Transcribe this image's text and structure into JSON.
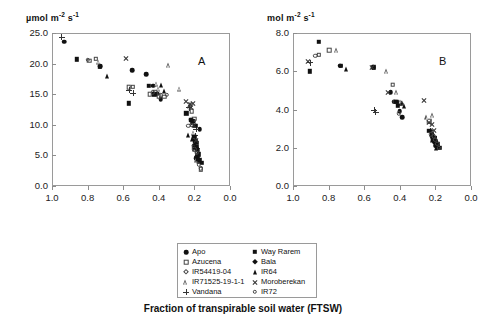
{
  "figure": {
    "xaxis_title": "Fraction of transpirable soil water (FTSW)"
  },
  "legend": {
    "left": [
      {
        "label": "Apo",
        "marker": "filled-circle"
      },
      {
        "label": "Azucena",
        "marker": "open-square"
      },
      {
        "label": "IR54419-04",
        "marker": "open-diamond"
      },
      {
        "label": "IR71525-19-1-1",
        "marker": "open-triangle"
      },
      {
        "label": "Vandana",
        "marker": "plus"
      }
    ],
    "right": [
      {
        "label": "Way Rarem",
        "marker": "filled-square"
      },
      {
        "label": "Bala",
        "marker": "filled-diamond"
      },
      {
        "label": "IR64",
        "marker": "filled-triangle"
      },
      {
        "label": "Moroberekan",
        "marker": "cross"
      },
      {
        "label": "IR72",
        "marker": "open-circle"
      }
    ]
  },
  "chart_data": [
    {
      "type": "scatter",
      "panel": "A",
      "title": "A",
      "unit_label": "µmol m⁻² s⁻¹",
      "ylabel": "µmol m⁻² s⁻¹",
      "xlabel": "Fraction of transpirable soil water (FTSW)",
      "xlim": [
        1.0,
        0.0
      ],
      "ylim": [
        0.0,
        25.0
      ],
      "xticks": [
        "1.0",
        "0.8",
        "0.6",
        "0.4",
        "0.2",
        "0.0"
      ],
      "yticks": [
        "0.0",
        "5.0",
        "10.0",
        "15.0",
        "20.0",
        "25.0"
      ],
      "x_reversed": true,
      "grid": false,
      "legend_position": "below-center",
      "series": [
        {
          "name": "Apo",
          "marker": "filled-circle",
          "points": [
            [
              0.93,
              23.6
            ],
            [
              0.73,
              19.6
            ],
            [
              0.55,
              18.9
            ],
            [
              0.47,
              18.3
            ],
            [
              0.43,
              16.4
            ],
            [
              0.41,
              15.1
            ],
            [
              0.39,
              14.2
            ],
            [
              0.22,
              10.8
            ],
            [
              0.205,
              10.6
            ],
            [
              0.17,
              9.3
            ],
            [
              0.2,
              6.6
            ],
            [
              0.185,
              5.9
            ],
            [
              0.19,
              4.5
            ]
          ]
        },
        {
          "name": "Azucena",
          "marker": "open-square",
          "points": [
            [
              0.79,
              20.5
            ],
            [
              0.57,
              16.1
            ],
            [
              0.45,
              15.0
            ],
            [
              0.4,
              14.7
            ],
            [
              0.37,
              14.6
            ],
            [
              0.215,
              12.2
            ],
            [
              0.2,
              11.0
            ],
            [
              0.195,
              6.1
            ],
            [
              0.185,
              5.6
            ],
            [
              0.175,
              4.1
            ]
          ]
        },
        {
          "name": "IR54419-04",
          "marker": "open-diamond",
          "points": [
            [
              0.755,
              20.8
            ],
            [
              0.545,
              16.2
            ],
            [
              0.42,
              15.4
            ],
            [
              0.215,
              10.0
            ],
            [
              0.205,
              6.4
            ],
            [
              0.19,
              5.9
            ],
            [
              0.175,
              4.0
            ],
            [
              0.165,
              2.7
            ]
          ]
        },
        {
          "name": "IR71525-19-1-1",
          "marker": "open-triangle",
          "points": [
            [
              0.735,
              20.3
            ],
            [
              0.345,
              19.7
            ],
            [
              0.41,
              16.7
            ],
            [
              0.4,
              15.9
            ],
            [
              0.28,
              15.9
            ],
            [
              0.225,
              13.0
            ],
            [
              0.22,
              13.4
            ],
            [
              0.205,
              8.7
            ],
            [
              0.195,
              6.0
            ],
            [
              0.185,
              4.3
            ]
          ]
        },
        {
          "name": "Vandana",
          "marker": "plus",
          "points": [
            [
              0.945,
              24.3
            ],
            [
              0.565,
              15.7
            ],
            [
              0.545,
              15.2
            ],
            [
              0.23,
              12.8
            ],
            [
              0.215,
              10.5
            ],
            [
              0.19,
              9.3
            ],
            [
              0.195,
              8.2
            ],
            [
              0.185,
              6.2
            ]
          ]
        },
        {
          "name": "Way Rarem",
          "marker": "filled-square",
          "points": [
            [
              0.86,
              20.7
            ],
            [
              0.57,
              13.5
            ],
            [
              0.245,
              11.9
            ],
            [
              0.22,
              10.8
            ],
            [
              0.195,
              9.8
            ],
            [
              0.19,
              7.1
            ],
            [
              0.185,
              6.3
            ],
            [
              0.175,
              5.2
            ],
            [
              0.17,
              4.2
            ],
            [
              0.16,
              3.8
            ]
          ]
        },
        {
          "name": "Bala",
          "marker": "filled-diamond",
          "points": [
            [
              0.73,
              19.5
            ],
            [
              0.455,
              16.4
            ],
            [
              0.425,
              15.0
            ],
            [
              0.215,
              10.7
            ],
            [
              0.2,
              8.0
            ],
            [
              0.195,
              7.3
            ],
            [
              0.185,
              6.0
            ],
            [
              0.18,
              4.6
            ]
          ]
        },
        {
          "name": "IR64",
          "marker": "filled-triangle",
          "points": [
            [
              0.69,
              17.9
            ],
            [
              0.385,
              16.5
            ],
            [
              0.37,
              15.6
            ],
            [
              0.235,
              8.4
            ],
            [
              0.215,
              7.6
            ],
            [
              0.2,
              6.4
            ],
            [
              0.19,
              5.1
            ],
            [
              0.185,
              4.4
            ]
          ]
        },
        {
          "name": "Moroberekan",
          "marker": "cross",
          "points": [
            [
              0.585,
              20.9
            ],
            [
              0.25,
              13.8
            ],
            [
              0.225,
              13.3
            ],
            [
              0.22,
              12.9
            ],
            [
              0.2,
              9.9
            ],
            [
              0.21,
              13.5
            ],
            [
              0.19,
              7.4
            ]
          ]
        },
        {
          "name": "IR72",
          "marker": "open-circle",
          "points": [
            [
              0.8,
              20.6
            ],
            [
              0.435,
              15.3
            ],
            [
              0.39,
              14.8
            ],
            [
              0.355,
              14.9
            ],
            [
              0.235,
              9.8
            ],
            [
              0.2,
              6.0
            ],
            [
              0.185,
              5.4
            ],
            [
              0.175,
              3.5
            ],
            [
              0.165,
              2.9
            ]
          ]
        }
      ]
    },
    {
      "type": "scatter",
      "panel": "B",
      "title": "B",
      "unit_label": "mol m⁻² s⁻¹",
      "ylabel": "mol m⁻² s⁻¹",
      "xlabel": "Fraction of transpirable soil water (FTSW)",
      "xlim": [
        1.0,
        0.0
      ],
      "ylim": [
        0.0,
        8.0
      ],
      "xticks": [
        "1.0",
        "0.8",
        "0.6",
        "0.4",
        "0.2",
        "0.0"
      ],
      "yticks": [
        "0.0",
        "2.0",
        "4.0",
        "6.0",
        "8.0"
      ],
      "x_reversed": true,
      "grid": false,
      "legend_position": "below-center",
      "series": [
        {
          "name": "Apo",
          "marker": "filled-circle",
          "points": [
            [
              0.735,
              6.3
            ],
            [
              0.55,
              6.2
            ],
            [
              0.45,
              4.9
            ],
            [
              0.43,
              4.4
            ],
            [
              0.41,
              4.3
            ],
            [
              0.4,
              3.9
            ],
            [
              0.385,
              3.6
            ],
            [
              0.22,
              2.6
            ],
            [
              0.205,
              2.5
            ],
            [
              0.195,
              2.2
            ],
            [
              0.185,
              2.0
            ]
          ]
        },
        {
          "name": "Azucena",
          "marker": "open-square",
          "points": [
            [
              0.795,
              7.1
            ],
            [
              0.44,
              5.3
            ],
            [
              0.425,
              4.4
            ],
            [
              0.405,
              4.3
            ],
            [
              0.235,
              3.4
            ],
            [
              0.215,
              2.6
            ],
            [
              0.205,
              2.4
            ],
            [
              0.195,
              2.2
            ]
          ]
        },
        {
          "name": "IR54419-04",
          "marker": "open-diamond",
          "points": [
            [
              0.855,
              6.85
            ],
            [
              0.4,
              4.35
            ],
            [
              0.215,
              2.5
            ],
            [
              0.2,
              2.3
            ],
            [
              0.19,
              2.1
            ]
          ]
        },
        {
          "name": "IR71525-19-1-1",
          "marker": "open-triangle",
          "points": [
            [
              0.755,
              7.1
            ],
            [
              0.475,
              6.0
            ],
            [
              0.415,
              4.9
            ],
            [
              0.395,
              4.4
            ],
            [
              0.245,
              3.6
            ],
            [
              0.215,
              3.7
            ],
            [
              0.19,
              2.4
            ],
            [
              0.18,
              2.2
            ]
          ]
        },
        {
          "name": "Vandana",
          "marker": "plus",
          "points": [
            [
              0.905,
              6.45
            ],
            [
              0.545,
              3.95
            ],
            [
              0.535,
              3.85
            ],
            [
              0.23,
              2.9
            ],
            [
              0.21,
              2.6
            ],
            [
              0.2,
              2.3
            ]
          ]
        },
        {
          "name": "Way Rarem",
          "marker": "filled-square",
          "points": [
            [
              0.855,
              7.55
            ],
            [
              0.545,
              6.2
            ],
            [
              0.235,
              2.9
            ],
            [
              0.22,
              2.7
            ],
            [
              0.205,
              2.5
            ],
            [
              0.2,
              2.3
            ],
            [
              0.19,
              2.2
            ],
            [
              0.175,
              2.0
            ]
          ]
        },
        {
          "name": "Bala",
          "marker": "filled-diamond",
          "points": [
            [
              0.905,
              6.0
            ],
            [
              0.73,
              6.3
            ],
            [
              0.42,
              4.4
            ],
            [
              0.41,
              4.2
            ],
            [
              0.215,
              2.5
            ],
            [
              0.2,
              2.3
            ],
            [
              0.195,
              2.1
            ]
          ]
        },
        {
          "name": "IR64",
          "marker": "filled-triangle",
          "points": [
            [
              0.7,
              6.1
            ],
            [
              0.385,
              4.35
            ],
            [
              0.375,
              4.2
            ],
            [
              0.22,
              2.4
            ],
            [
              0.205,
              2.2
            ],
            [
              0.195,
              2.0
            ]
          ]
        },
        {
          "name": "Moroberekan",
          "marker": "cross",
          "points": [
            [
              0.915,
              6.5
            ],
            [
              0.555,
              6.2
            ],
            [
              0.465,
              4.9
            ],
            [
              0.265,
              4.5
            ],
            [
              0.235,
              3.3
            ],
            [
              0.22,
              3.2
            ],
            [
              0.21,
              2.9
            ]
          ]
        },
        {
          "name": "IR72",
          "marker": "open-circle",
          "points": [
            [
              0.875,
              6.8
            ],
            [
              0.405,
              3.8
            ],
            [
              0.39,
              4.3
            ],
            [
              0.225,
              2.7
            ],
            [
              0.21,
              2.6
            ],
            [
              0.2,
              2.4
            ],
            [
              0.19,
              2.2
            ],
            [
              0.18,
              2.0
            ]
          ]
        }
      ]
    }
  ]
}
